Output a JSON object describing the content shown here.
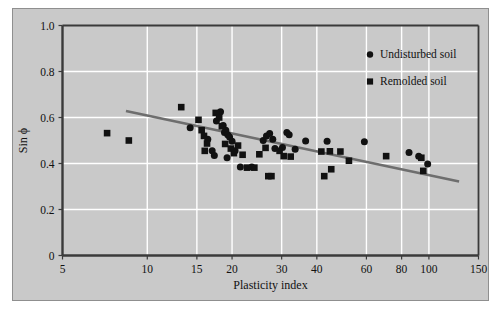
{
  "chart_data": {
    "type": "scatter",
    "title": "",
    "xlabel": "Plasticity index",
    "ylabel": "Sin ϕ",
    "xscale": "log",
    "xlim": [
      5,
      150
    ],
    "ylim": [
      0,
      1.0
    ],
    "xticks": [
      5,
      10,
      15,
      20,
      30,
      40,
      60,
      80,
      100,
      150
    ],
    "xticklabels": [
      "5",
      "10",
      "15",
      "20",
      "30",
      "40",
      "60",
      "80",
      "100",
      "150"
    ],
    "yticks": [
      0,
      0.2,
      0.4,
      0.6,
      0.8,
      1.0
    ],
    "yticklabels": [
      "0",
      "0.2",
      "0.4",
      "0.6",
      "0.8",
      "1.0"
    ],
    "grid": true,
    "grid_color": "#ffffff",
    "plot_bg": "#c9c9c9",
    "legend_position": "top-right",
    "series": [
      {
        "name": "Undisturbed soil",
        "marker": "circle",
        "color": "#111111",
        "points": [
          [
            14.2,
            0.555
          ],
          [
            17.6,
            0.585
          ],
          [
            18.2,
            0.625
          ],
          [
            18.6,
            0.565
          ],
          [
            16.4,
            0.505
          ],
          [
            17.0,
            0.455
          ],
          [
            17.3,
            0.435
          ],
          [
            18.8,
            0.535
          ],
          [
            19.0,
            0.545
          ],
          [
            19.3,
            0.525
          ],
          [
            19.6,
            0.515
          ],
          [
            20.0,
            0.497
          ],
          [
            19.2,
            0.425
          ],
          [
            20.5,
            0.455
          ],
          [
            21.4,
            0.385
          ],
          [
            23.5,
            0.385
          ],
          [
            25.8,
            0.5
          ],
          [
            26.5,
            0.52
          ],
          [
            27.2,
            0.53
          ],
          [
            27.9,
            0.505
          ],
          [
            28.4,
            0.465
          ],
          [
            30.2,
            0.47
          ],
          [
            31.3,
            0.535
          ],
          [
            31.9,
            0.525
          ],
          [
            33.5,
            0.462
          ],
          [
            36.5,
            0.498
          ],
          [
            43.5,
            0.497
          ],
          [
            59.0,
            0.495
          ],
          [
            85.0,
            0.448
          ],
          [
            92.0,
            0.432
          ],
          [
            99.0,
            0.398
          ]
        ]
      },
      {
        "name": "Remolded soil",
        "marker": "square",
        "color": "#111111",
        "points": [
          [
            7.2,
            0.532
          ],
          [
            8.6,
            0.5
          ],
          [
            13.2,
            0.645
          ],
          [
            15.2,
            0.59
          ],
          [
            15.6,
            0.545
          ],
          [
            15.9,
            0.52
          ],
          [
            16.3,
            0.487
          ],
          [
            16.0,
            0.455
          ],
          [
            17.5,
            0.62
          ],
          [
            18.0,
            0.6
          ],
          [
            18.4,
            0.562
          ],
          [
            18.9,
            0.485
          ],
          [
            19.8,
            0.465
          ],
          [
            20.3,
            0.445
          ],
          [
            21.0,
            0.478
          ],
          [
            21.8,
            0.438
          ],
          [
            22.6,
            0.382
          ],
          [
            24.0,
            0.382
          ],
          [
            25.0,
            0.44
          ],
          [
            26.3,
            0.468
          ],
          [
            26.9,
            0.345
          ],
          [
            27.6,
            0.345
          ],
          [
            29.5,
            0.455
          ],
          [
            30.5,
            0.432
          ],
          [
            32.3,
            0.43
          ],
          [
            41.5,
            0.452
          ],
          [
            42.5,
            0.345
          ],
          [
            44.5,
            0.453
          ],
          [
            45.0,
            0.375
          ],
          [
            48.5,
            0.452
          ],
          [
            52.0,
            0.412
          ],
          [
            70.5,
            0.432
          ],
          [
            94.0,
            0.425
          ],
          [
            95.5,
            0.368
          ]
        ]
      }
    ],
    "trendline": {
      "name": "linear-fit",
      "color": "#6e6e6e",
      "x_start": 8.4,
      "y_start": 0.628,
      "x_end": 128.0,
      "y_end": 0.322
    }
  },
  "legend": {
    "items": [
      {
        "label": "Undisturbed soil",
        "marker": "circle"
      },
      {
        "label": "Remolded soil",
        "marker": "square"
      }
    ]
  }
}
